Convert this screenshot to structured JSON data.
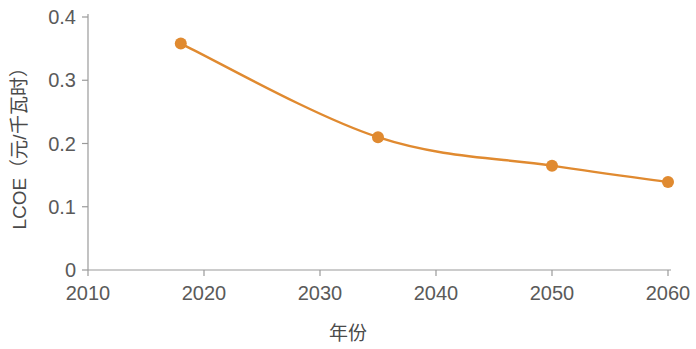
{
  "chart_data": {
    "type": "line",
    "title": "",
    "subtitle": "",
    "xlabel": "年份",
    "ylabel": "LCOE（元/千瓦时）",
    "xlim": [
      2010,
      2060
    ],
    "ylim": [
      0,
      0.4
    ],
    "x": [
      2018,
      2035,
      2050,
      2060
    ],
    "values": [
      0.358,
      0.21,
      0.165,
      0.139
    ],
    "series": [
      {
        "name": "LCOE",
        "x": [
          2018,
          2035,
          2050,
          2060
        ],
        "values": [
          0.358,
          0.21,
          0.165,
          0.139
        ]
      }
    ],
    "xticks": [
      2010,
      2020,
      2030,
      2040,
      2050,
      2060
    ],
    "xticklabels": [
      "2010",
      "2020",
      "2030",
      "2040",
      "2050",
      "2060"
    ],
    "yticks": [
      0,
      0.1,
      0.2,
      0.3,
      0.4
    ],
    "yticklabels": [
      "0",
      "0.1",
      "0.2",
      "0.3",
      "0.4"
    ],
    "grid": false,
    "legend": false,
    "legend_position": "none",
    "marker": "circle",
    "line_style": "smooth",
    "colors": {
      "series": "#E08A30",
      "axis": "#9a9a9a",
      "text": "#4a4a4a",
      "background": "#ffffff"
    },
    "annotations": []
  }
}
